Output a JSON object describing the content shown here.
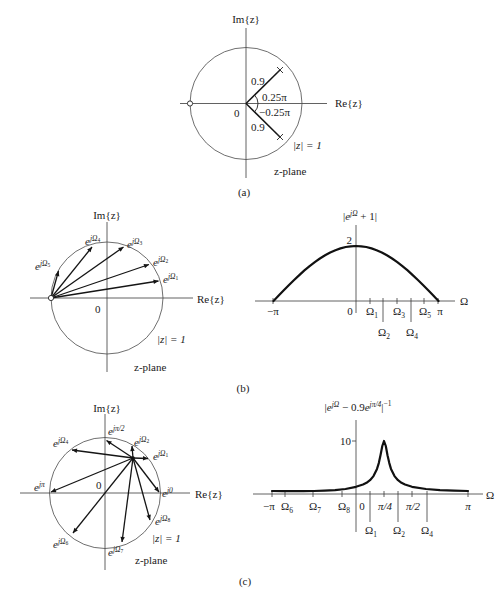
{
  "figure": {
    "a": {
      "im_axis": "Im{z}",
      "re_axis": "Re{z}",
      "origin": "0",
      "pole_radius_upper": "0.9",
      "pole_angle_upper": "0.25π",
      "pole_angle_lower": "−0.25π",
      "pole_radius_lower": "0.9",
      "unit_circle": "|z| = 1",
      "plane": "z-plane",
      "caption": "(a)"
    },
    "b": {
      "zplane": {
        "im_axis": "Im{z}",
        "re_axis": "Re{z}",
        "origin": "0",
        "unit_circle": "|z| = 1",
        "plane": "z-plane",
        "vectors": [
          {
            "base": "e",
            "sup": "jΩ",
            "sub": "1"
          },
          {
            "base": "e",
            "sup": "jΩ",
            "sub": "2"
          },
          {
            "base": "e",
            "sup": "jΩ",
            "sub": "3"
          },
          {
            "base": "e",
            "sup": "jΩ",
            "sub": "4"
          },
          {
            "base": "e",
            "sup": "jΩ",
            "sub": "5"
          }
        ]
      },
      "plot": {
        "title": {
          "bar_open": "|",
          "base": "e",
          "sup": "jΩ",
          "post": " + 1|"
        },
        "y_tick": "2",
        "x_axis": "Ω",
        "ticks_row1": [
          {
            "main": "−π",
            "sub": ""
          },
          {
            "main": "0",
            "sub": ""
          },
          {
            "main": "Ω",
            "sub": "1"
          },
          {
            "main": "Ω",
            "sub": "3"
          },
          {
            "main": "Ω",
            "sub": "5"
          },
          {
            "main": "π",
            "sub": ""
          }
        ],
        "ticks_row2": [
          {
            "main": "Ω",
            "sub": "2"
          },
          {
            "main": "Ω",
            "sub": "4"
          }
        ]
      },
      "caption": "(b)"
    },
    "c": {
      "zplane": {
        "im_axis": "Im{z}",
        "re_axis": "Re{z}",
        "origin": "0",
        "unit_circle": "|z| = 1",
        "plane": "z-plane",
        "vectors": [
          {
            "base": "e",
            "sup": "jπ/2",
            "sub": ""
          },
          {
            "base": "e",
            "sup": "jΩ",
            "sub": "2"
          },
          {
            "base": "e",
            "sup": "jΩ",
            "sub": "1"
          },
          {
            "base": "e",
            "sup": "j0",
            "sub": ""
          },
          {
            "base": "e",
            "sup": "jΩ",
            "sub": "8"
          },
          {
            "base": "e",
            "sup": "jΩ",
            "sub": "7"
          },
          {
            "base": "e",
            "sup": "jΩ",
            "sub": "6"
          },
          {
            "base": "e",
            "sup": "jπ",
            "sub": ""
          },
          {
            "base": "e",
            "sup": "jΩ",
            "sub": "4"
          }
        ]
      },
      "plot": {
        "title": {
          "bar_open": "|",
          "base1": "e",
          "sup1": "jΩ",
          "mid": " − 0.9",
          "base2": "e",
          "sup2": "jπ/4",
          "bar_close": "|",
          "sup3": "−1"
        },
        "y_tick": "10",
        "x_axis": "Ω",
        "ticks_row1": [
          {
            "main": "−π",
            "sub": ""
          },
          {
            "main": "Ω",
            "sub": "6"
          },
          {
            "main": "Ω",
            "sub": "7"
          },
          {
            "main": "Ω",
            "sub": "8"
          },
          {
            "main": "0",
            "sub": ""
          },
          {
            "main": "π/4",
            "sub": ""
          },
          {
            "main": "π/2",
            "sub": ""
          },
          {
            "main": "π",
            "sub": ""
          }
        ],
        "ticks_row2": [
          {
            "main": "Ω",
            "sub": "1"
          },
          {
            "main": "Ω",
            "sub": "2"
          },
          {
            "main": "Ω",
            "sub": "4"
          }
        ]
      },
      "caption": "(c)"
    }
  },
  "chart_data": [
    {
      "panel": "(b)",
      "type": "line",
      "title": "|e^{jΩ} + 1|",
      "xlabel": "Ω",
      "ylabel": "",
      "x_unit": "π",
      "xlim": [
        -1,
        1
      ],
      "ylim": [
        0,
        2
      ],
      "x_ticks": [
        -1,
        0,
        0.167,
        0.333,
        0.5,
        0.667,
        0.833,
        1
      ],
      "x_tick_labels": [
        "−π",
        "0",
        "Ω1",
        "Ω2",
        "Ω3",
        "Ω4",
        "Ω5",
        "π"
      ],
      "y_ticks": [
        2
      ],
      "y_tick_labels": [
        "2"
      ],
      "grid": false,
      "legend": null,
      "series": [
        {
          "name": "|e^{jΩ} + 1|",
          "x": [
            -1,
            -0.96875,
            -0.9375,
            -0.875,
            -0.8125,
            -0.75,
            -0.6875,
            -0.625,
            -0.5625,
            -0.5,
            -0.4375,
            -0.375,
            -0.3125,
            -0.25,
            -0.1875,
            -0.125,
            -0.0625,
            0,
            0.0625,
            0.125,
            0.1875,
            0.25,
            0.3125,
            0.375,
            0.4375,
            0.5,
            0.5625,
            0.625,
            0.6875,
            0.75,
            0.8125,
            0.875,
            0.9375,
            0.96875,
            1
          ],
          "y": [
            0,
            0.098,
            0.196,
            0.39,
            0.581,
            0.765,
            0.943,
            1.111,
            1.269,
            1.414,
            1.546,
            1.663,
            1.764,
            1.848,
            1.914,
            1.962,
            1.99,
            2,
            1.99,
            1.962,
            1.914,
            1.848,
            1.764,
            1.663,
            1.546,
            1.414,
            1.269,
            1.111,
            0.943,
            0.765,
            0.581,
            0.39,
            0.196,
            0.098,
            0
          ]
        }
      ]
    },
    {
      "panel": "(c)",
      "type": "line",
      "title": "|e^{jΩ} − 0.9e^{jπ/4}|^{−1}",
      "xlabel": "Ω",
      "ylabel": "",
      "x_unit": "π",
      "xlim": [
        -1,
        1
      ],
      "ylim": [
        0,
        10
      ],
      "x_ticks": [
        -1,
        -0.85,
        -0.5,
        -0.17,
        0,
        0.125,
        0.25,
        0.375,
        0.5,
        0.63,
        1
      ],
      "x_tick_labels": [
        "−π",
        "Ω6",
        "Ω7",
        "Ω8",
        "0",
        "Ω1",
        "π/4",
        "Ω2",
        "π/2",
        "Ω4",
        "π"
      ],
      "y_ticks": [
        10
      ],
      "y_tick_labels": [
        "10"
      ],
      "grid": false,
      "legend": null,
      "series": [
        {
          "name": "|e^{jΩ} − 0.9e^{jπ/4}|^{−1}",
          "x": [
            -1,
            -0.875,
            -0.75,
            -0.625,
            -0.5,
            -0.375,
            -0.25,
            -0.125,
            0,
            0.0625,
            0.09375,
            0.125,
            0.15625,
            0.1875,
            0.203125,
            0.21875,
            0.234375,
            0.25,
            0.265625,
            0.28125,
            0.296875,
            0.3125,
            0.34375,
            0.375,
            0.40625,
            0.4375,
            0.5,
            0.625,
            0.75,
            0.875,
            1
          ],
          "y": [
            0.57,
            0.537,
            0.526,
            0.537,
            0.57,
            0.633,
            0.743,
            0.944,
            1.364,
            1.786,
            2.12,
            2.608,
            3.381,
            4.736,
            5.824,
            7.317,
            9.066,
            10.0,
            9.066,
            7.317,
            5.824,
            4.736,
            3.381,
            2.608,
            2.12,
            1.786,
            1.364,
            0.944,
            0.743,
            0.633,
            0.57
          ]
        }
      ]
    }
  ]
}
